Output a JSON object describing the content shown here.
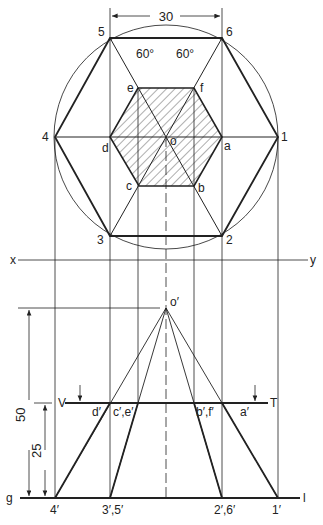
{
  "diagram": {
    "dimensions": {
      "width_top": "30",
      "height_total": "50",
      "height_section": "25",
      "angle_left": "60°",
      "angle_right": "60°"
    },
    "top_view_labels": {
      "p5": "5",
      "p6": "6",
      "p4": "4",
      "p1": "1",
      "p3": "3",
      "p2": "2",
      "e": "e",
      "f": "f",
      "d": "d",
      "o": "o",
      "a": "a",
      "c": "c",
      "b": "b"
    },
    "reference_labels": {
      "x": "x",
      "y": "y",
      "g": "g",
      "l": "l",
      "V": "V",
      "T": "T"
    },
    "front_view_labels": {
      "o_prime": "o′",
      "d_prime": "d′",
      "ce_prime": "c′,e′",
      "bf_prime": "b′,f′",
      "a_prime": "a′",
      "p4_prime": "4′",
      "p35_prime": "3′,5′",
      "p26_prime": "2′,6′",
      "p1_prime": "1′"
    },
    "colors": {
      "line": "#222222",
      "hatch": "#333333",
      "background": "#ffffff"
    }
  }
}
